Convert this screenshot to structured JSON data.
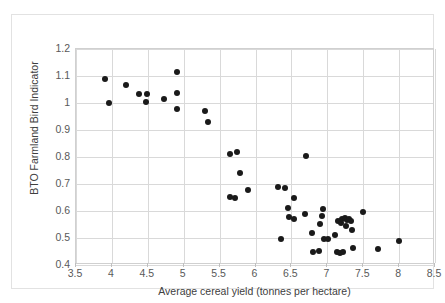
{
  "chart_data": {
    "type": "scatter",
    "title": "",
    "xlabel": "Average cereal yield (tonnes per hectare)",
    "ylabel": "BTO Farmland Bird Indicator",
    "xlim": [
      3.5,
      8.5
    ],
    "ylim": [
      0.4,
      1.2
    ],
    "xticks": [
      "3.5",
      "4",
      "4.5",
      "5",
      "5.5",
      "6",
      "6.5",
      "7",
      "7.5",
      "8",
      "8.5"
    ],
    "xtick_values": [
      3.5,
      4,
      4.5,
      5,
      5.5,
      6,
      6.5,
      7,
      7.5,
      8,
      8.5
    ],
    "yticks": [
      "0.4",
      "0.5",
      "0.6",
      "0.7",
      "0.8",
      "0.9",
      "1",
      "1.1",
      "1.2"
    ],
    "ytick_values": [
      0.4,
      0.5,
      0.6,
      0.7,
      0.8,
      0.9,
      1.0,
      1.1,
      1.2
    ],
    "grid": true,
    "legend": false,
    "marker_color": "#1a1a1a",
    "marker_shape": "circle",
    "points": [
      {
        "x": 3.9,
        "y": 1.089
      },
      {
        "x": 3.96,
        "y": 1.0
      },
      {
        "x": 4.2,
        "y": 1.065
      },
      {
        "x": 4.38,
        "y": 1.033
      },
      {
        "x": 4.49,
        "y": 1.034
      },
      {
        "x": 4.48,
        "y": 1.004
      },
      {
        "x": 4.72,
        "y": 1.013
      },
      {
        "x": 4.9,
        "y": 1.115
      },
      {
        "x": 4.91,
        "y": 1.037
      },
      {
        "x": 4.9,
        "y": 0.979
      },
      {
        "x": 5.3,
        "y": 0.971
      },
      {
        "x": 5.34,
        "y": 0.931
      },
      {
        "x": 5.64,
        "y": 0.811
      },
      {
        "x": 5.74,
        "y": 0.818
      },
      {
        "x": 5.79,
        "y": 0.741
      },
      {
        "x": 5.89,
        "y": 0.677
      },
      {
        "x": 5.64,
        "y": 0.652
      },
      {
        "x": 5.72,
        "y": 0.649
      },
      {
        "x": 6.31,
        "y": 0.688
      },
      {
        "x": 6.41,
        "y": 0.686
      },
      {
        "x": 6.35,
        "y": 0.498
      },
      {
        "x": 6.45,
        "y": 0.611
      },
      {
        "x": 6.53,
        "y": 0.648
      },
      {
        "x": 6.47,
        "y": 0.576
      },
      {
        "x": 6.53,
        "y": 0.571
      },
      {
        "x": 6.7,
        "y": 0.805
      },
      {
        "x": 6.69,
        "y": 0.588
      },
      {
        "x": 6.78,
        "y": 0.517
      },
      {
        "x": 6.8,
        "y": 0.447
      },
      {
        "x": 6.88,
        "y": 0.452
      },
      {
        "x": 6.94,
        "y": 0.606
      },
      {
        "x": 6.92,
        "y": 0.583
      },
      {
        "x": 6.9,
        "y": 0.551
      },
      {
        "x": 6.95,
        "y": 0.498
      },
      {
        "x": 7.01,
        "y": 0.495
      },
      {
        "x": 7.11,
        "y": 0.512
      },
      {
        "x": 7.14,
        "y": 0.45
      },
      {
        "x": 7.17,
        "y": 0.446
      },
      {
        "x": 7.22,
        "y": 0.447
      },
      {
        "x": 7.15,
        "y": 0.562
      },
      {
        "x": 7.19,
        "y": 0.556
      },
      {
        "x": 7.21,
        "y": 0.57
      },
      {
        "x": 7.24,
        "y": 0.574
      },
      {
        "x": 7.27,
        "y": 0.567
      },
      {
        "x": 7.3,
        "y": 0.57
      },
      {
        "x": 7.33,
        "y": 0.562
      },
      {
        "x": 7.26,
        "y": 0.544
      },
      {
        "x": 7.34,
        "y": 0.529
      },
      {
        "x": 7.36,
        "y": 0.463
      },
      {
        "x": 7.5,
        "y": 0.595
      },
      {
        "x": 7.7,
        "y": 0.459
      },
      {
        "x": 8.0,
        "y": 0.488
      }
    ]
  }
}
